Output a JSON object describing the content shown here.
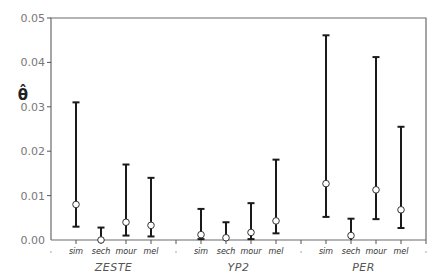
{
  "chart_data": {
    "type": "errorbar",
    "title": "",
    "xlabel": "",
    "ylabel": "θ̂",
    "ylim": [
      0.0,
      0.05
    ],
    "yticks": [
      0.0,
      0.01,
      0.02,
      0.03,
      0.04,
      0.05
    ],
    "ytick_labels": [
      "0.00",
      "0.01",
      "0.02",
      "0.03",
      "0.04",
      "0.05"
    ],
    "grid": false,
    "legend": null,
    "groups": [
      "ZESTE",
      "YP2",
      "PER"
    ],
    "categories": [
      "sim",
      "sech",
      "mour",
      "mel"
    ],
    "series": [
      {
        "group": "ZESTE",
        "points": [
          {
            "category": "sim",
            "estimate": 0.008,
            "lower": 0.003,
            "upper": 0.031
          },
          {
            "category": "sech",
            "estimate": 0.0,
            "lower": 0.0,
            "upper": 0.0028
          },
          {
            "category": "mour",
            "estimate": 0.004,
            "lower": 0.001,
            "upper": 0.017
          },
          {
            "category": "mel",
            "estimate": 0.0033,
            "lower": 0.0008,
            "upper": 0.014
          }
        ]
      },
      {
        "group": "YP2",
        "points": [
          {
            "category": "sim",
            "estimate": 0.0012,
            "lower": 0.0002,
            "upper": 0.007
          },
          {
            "category": "sech",
            "estimate": 0.0005,
            "lower": 0.0,
            "upper": 0.004
          },
          {
            "category": "mour",
            "estimate": 0.0017,
            "lower": 0.0002,
            "upper": 0.0083
          },
          {
            "category": "mel",
            "estimate": 0.0043,
            "lower": 0.0015,
            "upper": 0.0181
          }
        ]
      },
      {
        "group": "PER",
        "points": [
          {
            "category": "sim",
            "estimate": 0.0127,
            "lower": 0.0052,
            "upper": 0.0461
          },
          {
            "category": "sech",
            "estimate": 0.001,
            "lower": 0.0,
            "upper": 0.0048
          },
          {
            "category": "mour",
            "estimate": 0.0113,
            "lower": 0.0047,
            "upper": 0.0412
          },
          {
            "category": "mel",
            "estimate": 0.0068,
            "lower": 0.0027,
            "upper": 0.0255
          }
        ]
      }
    ]
  },
  "colors": {
    "axis": "#6b6b6b",
    "errorbar": "#1a1a1a",
    "marker_fill": "#ffffff",
    "marker_stroke": "#333333",
    "tick_label": "#777777"
  }
}
